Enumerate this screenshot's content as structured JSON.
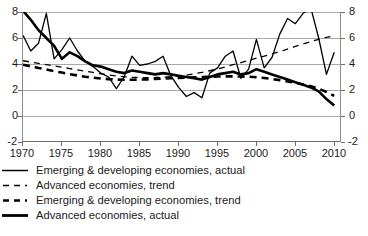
{
  "chart_data": {
    "type": "line",
    "title": "",
    "xlabel": "",
    "ylabel": "",
    "xlim": [
      1970,
      2011
    ],
    "ylim": [
      -2,
      8
    ],
    "yticks": [
      -2,
      0,
      2,
      4,
      6,
      8
    ],
    "xticks": [
      1970,
      1975,
      1980,
      1985,
      1990,
      1995,
      2000,
      2005,
      2010
    ],
    "grid": true,
    "dual_y_axis_labels": true,
    "legend_position": "below-plot-left",
    "ytick_labels": [
      "-2",
      "0",
      "2",
      "4",
      "6",
      "8"
    ],
    "xtick_labels": [
      "1970",
      "1975",
      "1980",
      "1985",
      "1990",
      "1995",
      "2000",
      "2005",
      "2010"
    ],
    "x": [
      1970,
      1971,
      1972,
      1973,
      1974,
      1975,
      1976,
      1977,
      1978,
      1979,
      1980,
      1981,
      1982,
      1983,
      1984,
      1985,
      1986,
      1987,
      1988,
      1989,
      1990,
      1991,
      1992,
      1993,
      1994,
      1995,
      1996,
      1997,
      1998,
      1999,
      2000,
      2001,
      2002,
      2003,
      2004,
      2005,
      2006,
      2007,
      2008,
      2009,
      2010
    ],
    "series": [
      {
        "name": "Emerging & developing economies, actual",
        "style": "solid",
        "width": "thin",
        "color": "#000000",
        "values": [
          6.2,
          5.0,
          5.6,
          7.9,
          4.4,
          5.1,
          6.0,
          5.0,
          4.2,
          3.8,
          3.3,
          3.0,
          2.1,
          3.0,
          4.6,
          3.9,
          4.0,
          4.2,
          4.6,
          3.1,
          2.2,
          1.5,
          1.8,
          1.4,
          3.3,
          3.7,
          4.6,
          5.0,
          2.9,
          3.6,
          5.9,
          3.7,
          4.5,
          6.3,
          7.5,
          7.1,
          7.9,
          8.3,
          6.0,
          3.2,
          4.9
        ]
      },
      {
        "name": "Advanced economies, trend",
        "style": "dashed",
        "width": "thin",
        "color": "#000000",
        "values": [
          4.25,
          4.15,
          4.05,
          3.95,
          3.85,
          3.75,
          3.65,
          3.55,
          3.45,
          3.35,
          3.25,
          3.15,
          3.08,
          3.02,
          2.98,
          2.96,
          2.95,
          2.96,
          2.98,
          3.02,
          3.08,
          3.15,
          3.25,
          3.35,
          3.48,
          3.62,
          3.78,
          3.95,
          4.1,
          4.28,
          4.45,
          4.6,
          4.78,
          4.95,
          5.15,
          5.35,
          5.55,
          5.72,
          5.9,
          6.05,
          6.15
        ]
      },
      {
        "name": "Emerging & developing economies, trend",
        "style": "dashed",
        "width": "thick",
        "color": "#000000",
        "values": [
          3.95,
          3.82,
          3.7,
          3.58,
          3.45,
          3.34,
          3.22,
          3.12,
          3.02,
          2.95,
          2.88,
          2.84,
          2.8,
          2.79,
          2.79,
          2.8,
          2.82,
          2.85,
          2.88,
          2.9,
          2.93,
          2.95,
          2.98,
          3.0,
          3.02,
          3.04,
          3.05,
          3.05,
          3.04,
          3.02,
          2.98,
          2.92,
          2.85,
          2.76,
          2.66,
          2.55,
          2.42,
          2.28,
          2.1,
          1.85,
          1.55
        ]
      },
      {
        "name": "Advanced economies, actual",
        "style": "solid",
        "width": "thick",
        "color": "#000000",
        "values": [
          8.1,
          7.4,
          6.6,
          6.0,
          5.4,
          4.4,
          4.9,
          4.6,
          4.2,
          3.9,
          3.8,
          3.6,
          3.4,
          3.3,
          3.5,
          3.4,
          3.3,
          3.2,
          3.3,
          3.2,
          3.1,
          3.0,
          2.9,
          2.8,
          3.0,
          3.2,
          3.3,
          3.4,
          3.2,
          3.3,
          3.6,
          3.4,
          3.2,
          3.0,
          2.8,
          2.6,
          2.4,
          2.2,
          1.9,
          1.3,
          0.8
        ]
      }
    ]
  },
  "legend": {
    "items": [
      {
        "label": "Emerging & developing economies, actual",
        "style": "solid",
        "weight": "thin"
      },
      {
        "label": "Advanced economies, trend",
        "style": "dashed",
        "weight": "thin"
      },
      {
        "label": "Emerging & developing economies, trend",
        "style": "dashed",
        "weight": "thick"
      },
      {
        "label": "Advanced economies, actual",
        "style": "solid",
        "weight": "thick"
      }
    ]
  },
  "caption": {
    "cutoff_text": ""
  }
}
